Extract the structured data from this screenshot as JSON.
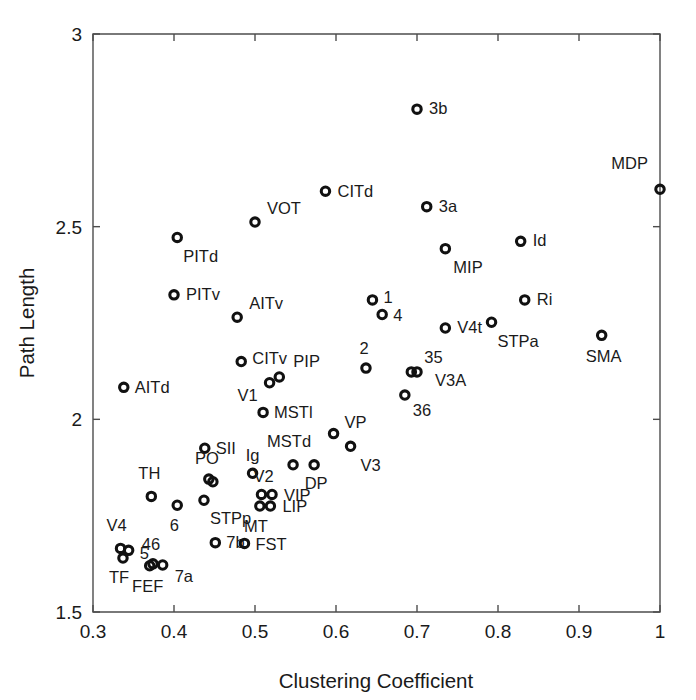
{
  "chart_data": {
    "type": "scatter",
    "title": "",
    "xlabel": "Clustering Coefficient",
    "ylabel": "Path Length",
    "xlim": [
      0.3,
      1.0
    ],
    "ylim": [
      1.5,
      3.0
    ],
    "xticks": [
      "0.3",
      "0.4",
      "0.5",
      "0.6",
      "0.7",
      "0.8",
      "0.9",
      "1"
    ],
    "xtick_values": [
      0.3,
      0.4,
      0.5,
      0.6,
      0.7,
      0.8,
      0.9,
      1.0
    ],
    "yticks": [
      "1.5",
      "2",
      "2.5",
      "3"
    ],
    "ytick_values": [
      1.5,
      2.0,
      2.5,
      3.0
    ],
    "grid": false,
    "legend": "none",
    "marker_style": "open-circle",
    "marker_color": "#111111",
    "points": [
      {
        "label": "3b",
        "x": 0.7,
        "y": 2.805,
        "lx": 12,
        "ly": 1
      },
      {
        "label": "CITd",
        "x": 0.587,
        "y": 2.592,
        "lx": 12,
        "ly": 1
      },
      {
        "label": "MDP",
        "x": 1.0,
        "y": 2.597,
        "lx": -12,
        "ly": -25,
        "anchor": "end"
      },
      {
        "label": "3a",
        "x": 0.712,
        "y": 2.552,
        "lx": 12,
        "ly": 1
      },
      {
        "label": "VOT",
        "x": 0.5,
        "y": 2.512,
        "lx": 12,
        "ly": -12
      },
      {
        "label": "Id",
        "x": 0.828,
        "y": 2.462,
        "lx": 12,
        "ly": 0
      },
      {
        "label": "PITd",
        "x": 0.404,
        "y": 2.472,
        "lx": 6,
        "ly": 20
      },
      {
        "label": "MIP",
        "x": 0.735,
        "y": 2.443,
        "lx": 8,
        "ly": 20
      },
      {
        "label": "PITv",
        "x": 0.4,
        "y": 2.323,
        "lx": 12,
        "ly": 1
      },
      {
        "label": "Ri",
        "x": 0.833,
        "y": 2.31,
        "lx": 12,
        "ly": 1
      },
      {
        "label": "1",
        "x": 0.645,
        "y": 2.31,
        "lx": 11,
        "ly": -1
      },
      {
        "label": "AITv",
        "x": 0.478,
        "y": 2.265,
        "lx": 12,
        "ly": -13
      },
      {
        "label": "4",
        "x": 0.657,
        "y": 2.272,
        "lx": 11,
        "ly": 2
      },
      {
        "label": "STPa",
        "x": 0.792,
        "y": 2.252,
        "lx": 6,
        "ly": 20
      },
      {
        "label": "V4t",
        "x": 0.735,
        "y": 2.237,
        "lx": 12,
        "ly": 1
      },
      {
        "label": "SMA",
        "x": 0.928,
        "y": 2.218,
        "lx": 2,
        "ly": 22,
        "anchor": "middle"
      },
      {
        "label": "CITv",
        "x": 0.483,
        "y": 2.15,
        "lx": 11,
        "ly": -2
      },
      {
        "label": "2",
        "x": 0.637,
        "y": 2.133,
        "lx": -2,
        "ly": -18,
        "anchor": "middle"
      },
      {
        "label": "35",
        "x": 0.693,
        "y": 2.123,
        "lx": 13,
        "ly": -13
      },
      {
        "label": "V3A",
        "x": 0.7,
        "y": 2.123,
        "lx": 18,
        "ly": 10
      },
      {
        "label": "AITd",
        "x": 0.338,
        "y": 2.083,
        "lx": 11,
        "ly": 1
      },
      {
        "label": "PIP",
        "x": 0.53,
        "y": 2.11,
        "lx": 14,
        "ly": -14
      },
      {
        "label": "V1",
        "x": 0.518,
        "y": 2.095,
        "lx": -12,
        "ly": 14,
        "anchor": "end"
      },
      {
        "label": "36",
        "x": 0.685,
        "y": 2.063,
        "lx": 8,
        "ly": 17
      },
      {
        "label": "MSTl",
        "x": 0.51,
        "y": 2.018,
        "lx": 11,
        "ly": 1
      },
      {
        "label": "VP",
        "x": 0.597,
        "y": 1.963,
        "lx": 11,
        "ly": -10
      },
      {
        "label": "V3",
        "x": 0.618,
        "y": 1.93,
        "lx": 10,
        "ly": 20
      },
      {
        "label": "SII",
        "x": 0.438,
        "y": 1.925,
        "lx": 11,
        "ly": 1
      },
      {
        "label": "MSTd",
        "x": 0.547,
        "y": 1.882,
        "lx": -4,
        "ly": -22,
        "anchor": "middle"
      },
      {
        "label": "DP",
        "x": 0.573,
        "y": 1.882,
        "lx": 2,
        "ly": 20,
        "anchor": "middle"
      },
      {
        "label": "Ig",
        "x": 0.497,
        "y": 1.86,
        "lx": 0,
        "ly": -17,
        "anchor": "middle"
      },
      {
        "label": "PO",
        "x": 0.443,
        "y": 1.845,
        "lx": -2,
        "ly": -19,
        "anchor": "middle"
      },
      {
        "label": "PO2",
        "x": 0.448,
        "y": 1.838,
        "lx": 0,
        "ly": 0,
        "anchor": "middle",
        "hide_label": true
      },
      {
        "label": "V2",
        "x": 0.508,
        "y": 1.805,
        "lx": 2,
        "ly": -17,
        "anchor": "middle"
      },
      {
        "label": "VIP",
        "x": 0.521,
        "y": 1.805,
        "lx": 12,
        "ly": 2
      },
      {
        "label": "TH",
        "x": 0.372,
        "y": 1.8,
        "lx": -2,
        "ly": -22,
        "anchor": "middle"
      },
      {
        "label": "6",
        "x": 0.404,
        "y": 1.777,
        "lx": -3,
        "ly": 21,
        "anchor": "middle"
      },
      {
        "label": "STPp",
        "x": 0.437,
        "y": 1.79,
        "lx": 6,
        "ly": 19
      },
      {
        "label": "MT",
        "x": 0.506,
        "y": 1.775,
        "lx": -4,
        "ly": 22,
        "anchor": "middle"
      },
      {
        "label": "LIP",
        "x": 0.519,
        "y": 1.775,
        "lx": 12,
        "ly": 2
      },
      {
        "label": "7b",
        "x": 0.451,
        "y": 1.68,
        "lx": 11,
        "ly": 1
      },
      {
        "label": "FST",
        "x": 0.487,
        "y": 1.678,
        "lx": 11,
        "ly": 2
      },
      {
        "label": "V4",
        "x": 0.334,
        "y": 1.665,
        "lx": -4,
        "ly": -22,
        "anchor": "middle"
      },
      {
        "label": "5",
        "x": 0.344,
        "y": 1.66,
        "lx": 11,
        "ly": 4
      },
      {
        "label": "TF",
        "x": 0.337,
        "y": 1.64,
        "lx": -4,
        "ly": 21,
        "anchor": "middle"
      },
      {
        "label": "46",
        "x": 0.374,
        "y": 1.625,
        "lx": -2,
        "ly": -18,
        "anchor": "middle"
      },
      {
        "label": "FEF",
        "x": 0.37,
        "y": 1.62,
        "lx": -2,
        "ly": 22,
        "anchor": "middle"
      },
      {
        "label": "7a",
        "x": 0.386,
        "y": 1.622,
        "lx": 12,
        "ly": 13
      }
    ]
  }
}
